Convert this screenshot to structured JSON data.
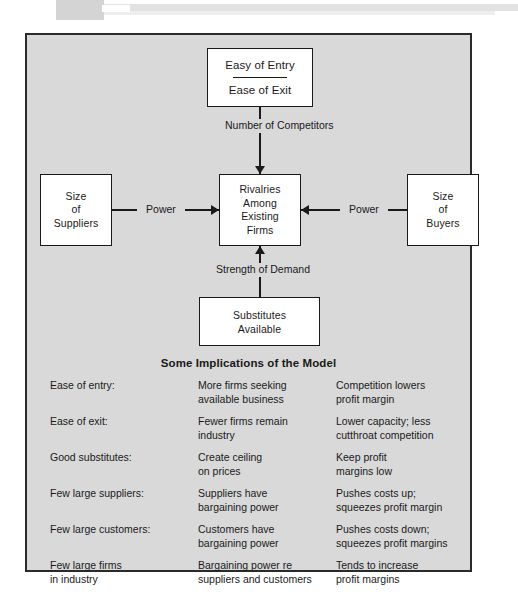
{
  "diagram": {
    "boxes": {
      "entry": {
        "top_label": "Easy of Entry",
        "bottom_label": "Ease of Exit"
      },
      "center": {
        "line1": "Rivalries",
        "line2": "Among",
        "line3": "Existing",
        "line4": "Firms"
      },
      "suppliers": {
        "line1": "Size",
        "line2": "of",
        "line3": "Suppliers"
      },
      "buyers": {
        "line1": "Size",
        "line2": "of",
        "line3": "Buyers"
      },
      "substitutes": {
        "line1": "Substitutes",
        "line2": "Available"
      }
    },
    "edge_labels": {
      "competitors_line1": "Number of",
      "competitors_line2": "Competitors",
      "demand": "Strength of Demand",
      "power_left": "Power",
      "power_right": "Power"
    }
  },
  "implications": {
    "title": "Some Implications of the Model",
    "rows": [
      {
        "factor": "Ease of entry:",
        "effect_line1": "More firms seeking",
        "effect_line2": "available business",
        "result_line1": "Competition lowers",
        "result_line2": "profit margin"
      },
      {
        "factor": "Ease of exit:",
        "effect_line1": "Fewer firms remain",
        "effect_line2": "industry",
        "result_line1": "Lower capacity; less",
        "result_line2": "cutthroat competition"
      },
      {
        "factor": "Good substitutes:",
        "effect_line1": "Create ceiling",
        "effect_line2": "on prices",
        "result_line1": "Keep profit",
        "result_line2": "margins low"
      },
      {
        "factor": "Few large suppliers:",
        "effect_line1": "Suppliers have",
        "effect_line2": "bargaining power",
        "result_line1": "Pushes costs up;",
        "result_line2": "squeezes profit margin"
      },
      {
        "factor": "Few large customers:",
        "effect_line1": "Customers have",
        "effect_line2": "bargaining power",
        "result_line1": "Pushes costs down;",
        "result_line2": "squeezes profit margins"
      },
      {
        "factor_line1": "Few large firms",
        "factor_line2": "in industry",
        "effect_line1": "Bargaining power re",
        "effect_line2": "suppliers and customers",
        "result_line1": "Tends to increase",
        "result_line2": "profit margins"
      }
    ]
  }
}
